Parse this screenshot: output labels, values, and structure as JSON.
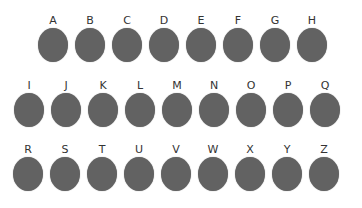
{
  "colors": {
    "circle": "#626262",
    "label": "#333333",
    "background": "#ffffff"
  },
  "rows": [
    {
      "items": [
        {
          "label": "A"
        },
        {
          "label": "B"
        },
        {
          "label": "C"
        },
        {
          "label": "D"
        },
        {
          "label": "E"
        },
        {
          "label": "F"
        },
        {
          "label": "G"
        },
        {
          "label": "H"
        }
      ]
    },
    {
      "items": [
        {
          "label": "I"
        },
        {
          "label": "J"
        },
        {
          "label": "K"
        },
        {
          "label": "L"
        },
        {
          "label": "M"
        },
        {
          "label": "N"
        },
        {
          "label": "O"
        },
        {
          "label": "P"
        },
        {
          "label": "Q"
        }
      ]
    },
    {
      "items": [
        {
          "label": "R"
        },
        {
          "label": "S"
        },
        {
          "label": "T"
        },
        {
          "label": "U"
        },
        {
          "label": "V"
        },
        {
          "label": "W"
        },
        {
          "label": "X"
        },
        {
          "label": "Y"
        },
        {
          "label": "Z"
        }
      ]
    }
  ]
}
